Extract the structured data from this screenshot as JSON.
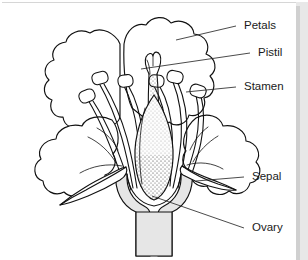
{
  "figure": {
    "kind": "botanical-diagram",
    "background_color": "#ffffff",
    "ink_color": "#111111",
    "label_color": "#1a1a1a",
    "receptacle_fill": "#e6e6e6",
    "border_color": "#d0d0d0"
  },
  "labels": [
    {
      "id": "petals",
      "text": "Petals",
      "x": 244,
      "y": 26,
      "line_from_x": 236,
      "line_from_y": 26,
      "line_to_x": 176,
      "line_to_y": 40
    },
    {
      "id": "pistil",
      "text": "Pistil",
      "x": 258,
      "y": 53,
      "line_from_x": 250,
      "line_from_y": 53,
      "line_to_x": 141,
      "line_to_y": 69
    },
    {
      "id": "stamen",
      "text": "Stamen",
      "x": 244,
      "y": 87,
      "line_from_x": 236,
      "line_from_y": 87,
      "line_to_x": 186,
      "line_to_y": 92
    },
    {
      "id": "sepal",
      "text": "Sepal",
      "x": 252,
      "y": 177,
      "line_from_x": 244,
      "line_from_y": 177,
      "line_to_x": 196,
      "line_to_y": 181
    },
    {
      "id": "ovary",
      "text": "Ovary",
      "x": 252,
      "y": 228,
      "line_from_x": 244,
      "line_from_y": 228,
      "line_to_x": 152,
      "line_to_y": 196
    }
  ],
  "parts": {
    "petals_label": "Petals",
    "pistil_label": "Pistil",
    "stamen_label": "Stamen",
    "sepal_label": "Sepal",
    "ovary_label": "Ovary"
  },
  "structure": {
    "stamen_count": 6,
    "sepal_count": 2,
    "petal_lobe_count": 4,
    "has_stem": true,
    "ovary_texture": "stippled",
    "sepal_texture": "cross-hatched"
  }
}
